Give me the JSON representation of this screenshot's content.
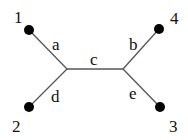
{
  "diagram": {
    "type": "unrooted-tree",
    "leaves": [
      {
        "id": "1",
        "label": "1",
        "x": 29,
        "y": 30,
        "lx": 20,
        "ly": 22
      },
      {
        "id": "2",
        "label": "2",
        "x": 29,
        "y": 107,
        "lx": 18,
        "ly": 124
      },
      {
        "id": "3",
        "label": "3",
        "x": 160,
        "y": 107,
        "lx": 174,
        "ly": 124
      },
      {
        "id": "4",
        "label": "4",
        "x": 159,
        "y": 29,
        "lx": 175,
        "ly": 19
      }
    ],
    "internal_nodes": [
      {
        "id": "L",
        "x": 67,
        "y": 69
      },
      {
        "id": "R",
        "x": 123,
        "y": 69
      }
    ],
    "edges": [
      {
        "label": "a",
        "from": "1",
        "to": "L"
      },
      {
        "label": "d",
        "from": "2",
        "to": "L"
      },
      {
        "label": "c",
        "from": "L",
        "to": "R"
      },
      {
        "label": "b",
        "from": "4",
        "to": "R"
      },
      {
        "label": "e",
        "from": "3",
        "to": "R"
      }
    ],
    "edge_labels": {
      "a": "a",
      "b": "b",
      "c": "c",
      "d": "d",
      "e": "e"
    }
  }
}
